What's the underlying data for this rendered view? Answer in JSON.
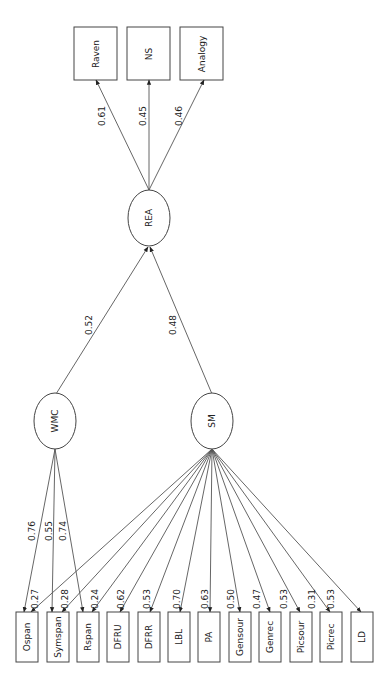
{
  "diagram": {
    "type": "structural-equation-model",
    "orientation": "rotated-90",
    "latent_factors": [
      {
        "id": "REA",
        "label": "REA"
      },
      {
        "id": "WMC",
        "label": "WMC"
      },
      {
        "id": "SM",
        "label": "SM"
      }
    ],
    "top_indicators": [
      {
        "label": "Raven",
        "loading": "0.61"
      },
      {
        "label": "NS",
        "loading": "0.45"
      },
      {
        "label": "Analogy",
        "loading": "0.46"
      }
    ],
    "structural_paths": [
      {
        "from": "WMC",
        "to": "REA",
        "weight": "0.52"
      },
      {
        "from": "SM",
        "to": "REA",
        "weight": "0.48"
      }
    ],
    "wmc_loadings": [
      {
        "indicator": "Ospan",
        "weight": "0.76"
      },
      {
        "indicator": "Symspan",
        "weight": "0.55"
      },
      {
        "indicator": "Rspan",
        "weight": "0.74"
      }
    ],
    "bottom_indicators": [
      {
        "label": "Ospan",
        "sm_loading": "0.27"
      },
      {
        "label": "Symspan",
        "sm_loading": "0.28"
      },
      {
        "label": "Rspan",
        "sm_loading": "0.24"
      },
      {
        "label": "DFRU",
        "sm_loading": "0.62"
      },
      {
        "label": "DFRR",
        "sm_loading": "0.53"
      },
      {
        "label": "LBL",
        "sm_loading": "0.70"
      },
      {
        "label": "PA",
        "sm_loading": "0.63"
      },
      {
        "label": "Gensour",
        "sm_loading": "0.50"
      },
      {
        "label": "Genrec",
        "sm_loading": "0.47"
      },
      {
        "label": "Picsour",
        "sm_loading": "0.53"
      },
      {
        "label": "Picrec",
        "sm_loading": "0.31"
      },
      {
        "label": "LD",
        "sm_loading": "0.53"
      }
    ]
  }
}
